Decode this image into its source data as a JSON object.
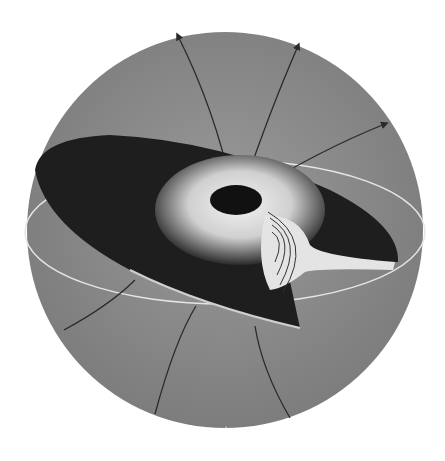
{
  "figure": {
    "colors": {
      "background": "#ffffff",
      "sphere": "#8a8a8a",
      "disk": "#1e1e1e",
      "disk_inner_light": "#e8e8e8",
      "equator_line": "#e6e6e6",
      "field_lines": "#2a2a2a"
    },
    "elements": {
      "sphere": "sphere",
      "disk": "accretion-disk",
      "central_hole": "central-hole",
      "equator": "equatorial-ring",
      "field_lines_up": 3,
      "field_lines_down": 3,
      "cutaway": "concentric-flow-cutaway"
    }
  }
}
